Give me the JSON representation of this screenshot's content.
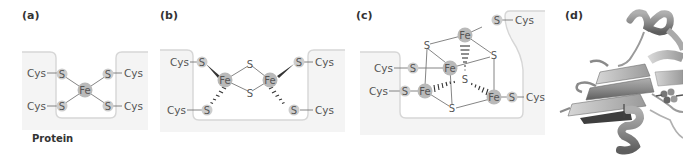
{
  "figure": {
    "panels": [
      {
        "label": "(a)",
        "center_atom": "Fe",
        "sulfurs": [
          "S",
          "S",
          "S",
          "S"
        ],
        "ligands": [
          "Cys",
          "Cys",
          "Cys",
          "Cys"
        ],
        "caption": "Protein"
      },
      {
        "label": "(b)",
        "irons": [
          "Fe",
          "Fe"
        ],
        "bridging_sulfurs": [
          "S",
          "S"
        ],
        "terminal_sulfurs": [
          "S",
          "S",
          "S",
          "S"
        ],
        "ligands": [
          "Cys",
          "Cys",
          "Cys",
          "Cys"
        ]
      },
      {
        "label": "(c)",
        "irons": [
          "Fe",
          "Fe",
          "Fe",
          "Fe"
        ],
        "cube_sulfurs": [
          "S",
          "S",
          "S",
          "S"
        ],
        "terminal_sulfurs": [
          "S",
          "S",
          "S",
          "S"
        ],
        "ligands": [
          "Cys",
          "Cys",
          "Cys",
          "Cys"
        ]
      },
      {
        "label": "(d)",
        "image": "protein-ribbon-structure"
      }
    ],
    "colors": {
      "iron_fill": "#b9b9b9",
      "sulfur_fill": "#cdcdcd",
      "bond": "#777777",
      "outline": "#d6d6d6",
      "ribbon": "#8a8a8a"
    }
  }
}
